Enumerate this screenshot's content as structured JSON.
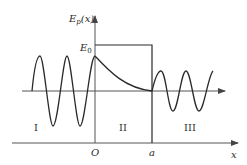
{
  "diagram": {
    "type": "quantum-tunneling-barrier",
    "y_axis_label": {
      "main": "E",
      "sub": "p",
      "arg": "(x)"
    },
    "barrier_height_label": {
      "main": "E",
      "sub": "0"
    },
    "x_axis_label": "x",
    "origin_label": "O",
    "barrier_end_label": "a",
    "regions": [
      {
        "id": "I",
        "label": "I"
      },
      {
        "id": "II",
        "label": "II"
      },
      {
        "id": "III",
        "label": "III"
      }
    ],
    "colors": {
      "line": "#2a2a2a",
      "axis": "#555555",
      "background": "#ffffff"
    }
  }
}
